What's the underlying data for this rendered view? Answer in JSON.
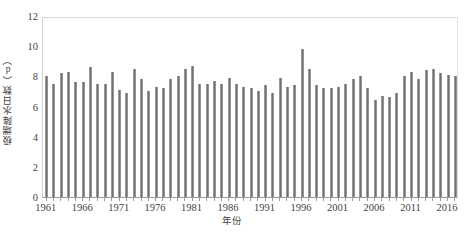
{
  "chart_data": {
    "type": "bar",
    "title": "",
    "xlabel": "年份",
    "ylabel": "极端降水日数（d）",
    "ylim": [
      0,
      12
    ],
    "yticks": [
      0,
      2,
      4,
      6,
      8,
      10,
      12
    ],
    "grid": false,
    "legend": null,
    "bar_color": "#757575",
    "categories": [
      1961,
      1962,
      1963,
      1964,
      1965,
      1966,
      1967,
      1968,
      1969,
      1970,
      1971,
      1972,
      1973,
      1974,
      1975,
      1976,
      1977,
      1978,
      1979,
      1980,
      1981,
      1982,
      1983,
      1984,
      1985,
      1986,
      1987,
      1988,
      1989,
      1990,
      1991,
      1992,
      1993,
      1994,
      1995,
      1996,
      1997,
      1998,
      1999,
      2000,
      2001,
      2002,
      2003,
      2004,
      2005,
      2006,
      2007,
      2008,
      2009,
      2010,
      2011,
      2012,
      2013,
      2014,
      2015,
      2016,
      2017
    ],
    "values": [
      8.0,
      7.5,
      8.2,
      8.3,
      7.6,
      7.6,
      8.6,
      7.5,
      7.5,
      8.3,
      7.1,
      6.9,
      8.5,
      7.8,
      7.0,
      7.3,
      7.2,
      7.8,
      8.0,
      8.5,
      8.7,
      7.5,
      7.5,
      7.7,
      7.5,
      7.9,
      7.5,
      7.3,
      7.2,
      7.0,
      7.4,
      6.9,
      7.9,
      7.3,
      7.4,
      9.8,
      8.5,
      7.4,
      7.2,
      7.2,
      7.3,
      7.5,
      7.8,
      8.0,
      7.2,
      6.4,
      6.7,
      6.6,
      6.9,
      8.0,
      8.3,
      7.8,
      8.4,
      8.5,
      8.2,
      8.1,
      8.0
    ],
    "xtick_labels": [
      1961,
      1966,
      1971,
      1976,
      1981,
      1986,
      1991,
      1996,
      2001,
      2006,
      2011,
      2016
    ]
  }
}
